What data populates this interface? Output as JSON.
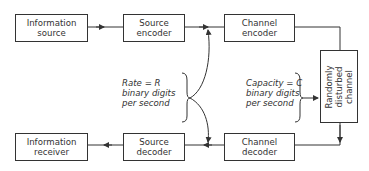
{
  "blocks": {
    "information_source": {
      "line1": "Information",
      "line2": "source"
    },
    "source_encoder": {
      "line1": "Source",
      "line2": "encoder"
    },
    "channel_encoder": {
      "line1": "Channel",
      "line2": "encoder"
    },
    "channel": {
      "line1": "Randomly",
      "line2": "disturbed",
      "line3": "channel"
    },
    "channel_decoder": {
      "line1": "Channel",
      "line2": "decoder"
    },
    "source_decoder": {
      "line1": "Source",
      "line2": "decoder"
    },
    "information_receiver": {
      "line1": "Information",
      "line2": "receiver"
    }
  },
  "annotations": {
    "rate": {
      "line1": "Rate = R",
      "line2": "binary digits",
      "line3": "per second"
    },
    "capacity": {
      "line1": "Capacity = C",
      "line2": "binary digits",
      "line3": "per second"
    }
  }
}
